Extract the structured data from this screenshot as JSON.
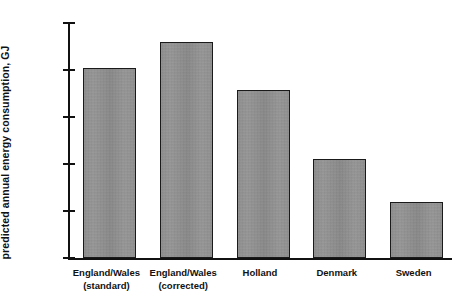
{
  "chart_data": {
    "type": "bar",
    "title": "",
    "xlabel": "",
    "ylabel": "predicted annual energy consumption, GJ",
    "categories": [
      "England/Wales\n(standard)",
      "England/Wales\n(corrected)",
      "Holland",
      "Denmark",
      "Sweden"
    ],
    "values": [
      40.5,
      46,
      35.8,
      21,
      12
    ],
    "ylim": [
      0,
      50
    ],
    "yticks": [
      0,
      10,
      20,
      30,
      40,
      50
    ],
    "ytick_labels": [
      "0",
      "10",
      "20",
      "30",
      "40",
      "50"
    ],
    "grid": false,
    "legend": false,
    "bar_color": "#9b9b9b",
    "bar_edge_color": "#1a1a1a",
    "axis_color": "#111111",
    "background": "#ffffff"
  }
}
